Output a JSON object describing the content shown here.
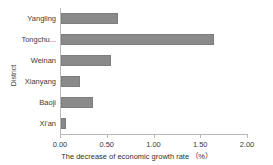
{
  "chart_data": {
    "type": "bar",
    "orientation": "horizontal",
    "title": "",
    "xlabel": "The decrease of economic growth rate （%）",
    "ylabel": "District",
    "categories": [
      "Yangling",
      "Tongchu...",
      "Weinan",
      "Xianyang",
      "Baoji",
      "Xi'an"
    ],
    "values": [
      0.61,
      1.64,
      0.54,
      0.2,
      0.34,
      0.05
    ],
    "series": [
      {
        "name": "The decrease of economic growth rate",
        "values": [
          0.61,
          1.64,
          0.54,
          0.2,
          0.34,
          0.05
        ]
      }
    ],
    "xlim": [
      0.0,
      2.0
    ],
    "xticks": [
      0.0,
      0.5,
      1.0,
      1.5,
      2.0
    ],
    "xtick_labels": [
      "0.00",
      "0.50",
      "1.00",
      "1.50",
      "2.00"
    ],
    "grid": false,
    "legend": false,
    "bar_color": "#8a8a8a",
    "axis_color": "#b9b9b9"
  },
  "axes": {
    "y_title": "District",
    "x_title": "The decrease of economic growth rate （%）"
  }
}
